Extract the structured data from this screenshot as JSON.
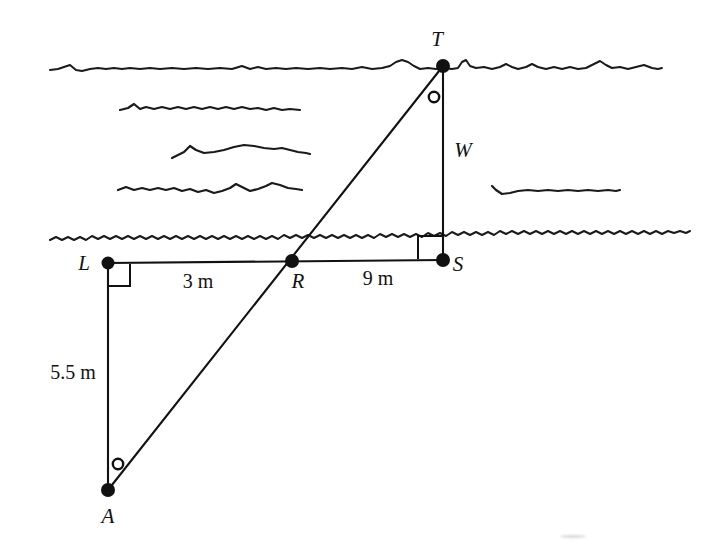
{
  "figure": {
    "stroke_color": "#111111",
    "background_color": "#ffffff"
  },
  "points": {
    "T": {
      "label": "T",
      "x": 443,
      "y": 66,
      "label_x": 437,
      "label_y": 46
    },
    "L": {
      "label": "L",
      "x": 108,
      "y": 263,
      "label_x": 84,
      "label_y": 270
    },
    "R": {
      "label": "R",
      "x": 292,
      "y": 261,
      "label_x": 293,
      "label_y": 285
    },
    "S": {
      "label": "S",
      "x": 443,
      "y": 260,
      "label_x": 452,
      "label_y": 270
    },
    "A": {
      "label": "A",
      "x": 108,
      "y": 490,
      "label_x": 101,
      "label_y": 520
    }
  },
  "segments": {
    "LS": {
      "from": "L",
      "to": "S",
      "kind": "baseline"
    },
    "LA": {
      "from": "L",
      "to": "A",
      "kind": "vertical",
      "measure": "5.5 m"
    },
    "AT": {
      "from": "A",
      "to": "T",
      "kind": "sight-line"
    },
    "TS": {
      "from": "T",
      "to": "S",
      "kind": "vertical",
      "measure": "W"
    }
  },
  "measurements": {
    "LR": {
      "text": "3 m",
      "x": 172,
      "y": 285
    },
    "RS": {
      "text": "9 m",
      "x": 352,
      "y": 283
    },
    "LA": {
      "text": "5.5 m",
      "x": 38,
      "y": 378
    },
    "TS": {
      "text": "W",
      "x": 455,
      "y": 157
    }
  },
  "angle_markers": {
    "at_L": {
      "type": "right-angle-square",
      "vertex": "L"
    },
    "at_S": {
      "type": "right-angle-square",
      "vertex": "S"
    },
    "at_A": {
      "type": "circle-marker",
      "vertex": "A"
    },
    "at_T": {
      "type": "circle-marker",
      "vertex": "T"
    }
  },
  "water": {
    "far_bank_line": {
      "y": 68,
      "x_start": 50,
      "x_end": 662
    },
    "near_bank_line": {
      "y": 237,
      "x_start": 50,
      "x_end": 690
    },
    "ripples": [
      {
        "y": 108,
        "x_start": 120,
        "x_end": 300
      },
      {
        "y": 152,
        "x_start": 172,
        "x_end": 310
      },
      {
        "y": 190,
        "x_start": 118,
        "x_end": 302
      },
      {
        "y": 190,
        "x_start": 492,
        "x_end": 620
      }
    ]
  }
}
